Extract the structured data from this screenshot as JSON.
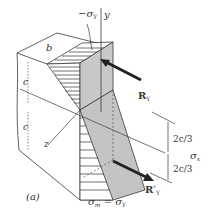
{
  "figure": {
    "panel_label": "(a)",
    "labels": {
      "top_stress": "−σ",
      "top_stress_sub": "Y",
      "y_axis": "y",
      "z_axis": "z",
      "width": "b",
      "upper_half_height": "c",
      "lower_half_height": "c",
      "resultant_top": "R",
      "resultant_top_sub": "Y",
      "resultant_bottom": "R′",
      "resultant_bottom_sub": "Y",
      "dim_upper": "2c/3",
      "dim_lower": "2c/3",
      "side_stress": "σ",
      "side_stress_sub": "x",
      "bottom_eq_lhs": "σ",
      "bottom_eq_lhs_sub": "m",
      "bottom_eq_mid": " = ",
      "bottom_eq_rhs": "σ",
      "bottom_eq_rhs_sub": "Y"
    },
    "colors": {
      "line": "#3a3a3a",
      "face_gray": "#c8c8c8",
      "face_gray_dark": "#b4b4b4",
      "arrow": "#222222",
      "text": "#333333"
    }
  }
}
